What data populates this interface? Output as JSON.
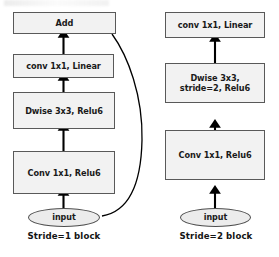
{
  "figure": {
    "type": "diagram",
    "colors": {
      "box_fill": "#f2f2f2",
      "box_stroke": "#595959",
      "ellipse_fill": "#ececec",
      "ellipse_stroke": "#4d4d4d",
      "arrow": "#000000",
      "background": "#ffffff",
      "text": "#1a1a1a"
    },
    "blocks": [
      {
        "id": "stride1",
        "caption": "Stride=1 block",
        "nodes": [
          {
            "id": "add",
            "shape": "rect",
            "lines": [
              "Add"
            ]
          },
          {
            "id": "conv-linear",
            "shape": "rect",
            "lines": [
              "conv 1x1, Linear"
            ]
          },
          {
            "id": "dwise",
            "shape": "rect",
            "lines": [
              "Dwise 3x3, Relu6"
            ]
          },
          {
            "id": "conv-relu",
            "shape": "rect",
            "lines": [
              "Conv 1x1, Relu6"
            ]
          },
          {
            "id": "input",
            "shape": "ellipse",
            "lines": [
              "input"
            ]
          }
        ],
        "edges": [
          {
            "from": "input",
            "to": "conv-relu",
            "style": "arrow"
          },
          {
            "from": "conv-relu",
            "to": "dwise",
            "style": "arrow"
          },
          {
            "from": "dwise",
            "to": "conv-linear",
            "style": "arrow"
          },
          {
            "from": "conv-linear",
            "to": "add",
            "style": "arrow"
          },
          {
            "from": "input",
            "to": "add",
            "style": "curved-skip-connection"
          }
        ]
      },
      {
        "id": "stride2",
        "caption": "Stride=2 block",
        "nodes": [
          {
            "id": "conv-linear",
            "shape": "rect",
            "lines": [
              "conv 1x1, Linear"
            ]
          },
          {
            "id": "dwise",
            "shape": "rect",
            "lines": [
              "Dwise 3x3,",
              "stride=2, Relu6"
            ]
          },
          {
            "id": "conv-relu",
            "shape": "rect",
            "lines": [
              "Conv 1x1, Relu6"
            ]
          },
          {
            "id": "input",
            "shape": "ellipse",
            "lines": [
              "input"
            ]
          }
        ],
        "edges": [
          {
            "from": "input",
            "to": "conv-relu",
            "style": "arrow"
          },
          {
            "from": "conv-relu",
            "to": "dwise",
            "style": "arrow"
          },
          {
            "from": "dwise",
            "to": "conv-linear",
            "style": "arrow"
          }
        ]
      }
    ]
  }
}
